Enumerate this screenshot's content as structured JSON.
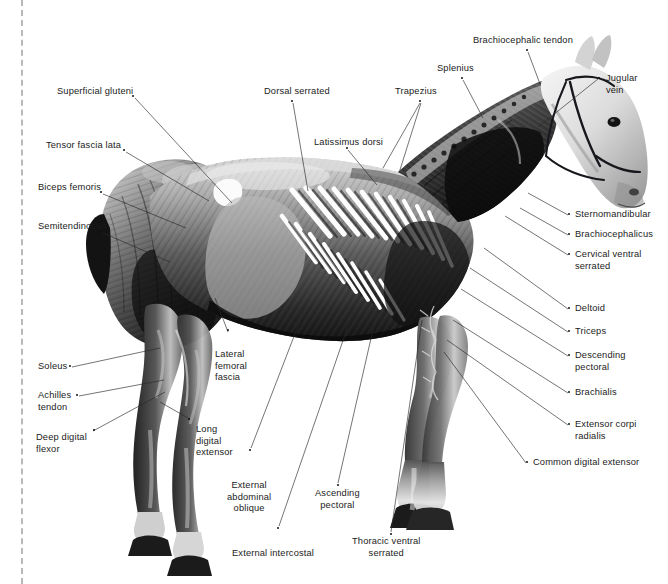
{
  "figure": {
    "view": "left lateral",
    "style": "grayscale anatomical photograph with leader-line callouts",
    "width": 668,
    "height": 584,
    "background_color": "#ffffff",
    "text_color": "#1b1b1b",
    "leader_color": "#2a2a2a",
    "trim_line_color": "#b9b9b9"
  },
  "labels": [
    {
      "id": "superficial-gluteni",
      "text": "Superficial gluteni",
      "side": "left",
      "x": 57,
      "y": 86,
      "align": "left",
      "dot": [
        133,
        96
      ],
      "leaders": [
        [
          [
            135,
            98
          ],
          [
            232,
            203
          ]
        ]
      ]
    },
    {
      "id": "tensor-fascia-lata",
      "text": "Tensor fascia lata",
      "side": "left",
      "x": 46,
      "y": 140,
      "align": "left",
      "dot": [
        124,
        150
      ],
      "leaders": [
        [
          [
            126,
            152
          ],
          [
            209,
            201
          ]
        ]
      ]
    },
    {
      "id": "biceps-femoris",
      "text": "Biceps femoris",
      "side": "left",
      "x": 38,
      "y": 182,
      "align": "left",
      "dot": [
        101,
        192
      ],
      "leaders": [
        [
          [
            103,
            194
          ],
          [
            186,
            228
          ]
        ]
      ]
    },
    {
      "id": "semitendinosus",
      "text": "Semitendinosus",
      "side": "left",
      "x": 38,
      "y": 221,
      "align": "left",
      "dot": [
        101,
        231
      ],
      "leaders": [
        [
          [
            103,
            233
          ],
          [
            170,
            262
          ]
        ]
      ]
    },
    {
      "id": "soleus",
      "text": "Soleus",
      "side": "left",
      "x": 38,
      "y": 361,
      "align": "left",
      "dot": [
        70,
        366
      ],
      "leaders": [
        [
          [
            72,
            367
          ],
          [
            160,
            348
          ]
        ]
      ]
    },
    {
      "id": "achilles-tendon",
      "text": "Achilles\ntendon",
      "side": "left",
      "x": 38,
      "y": 390,
      "align": "left",
      "dot": [
        77,
        395
      ],
      "leaders": [
        [
          [
            79,
            396
          ],
          [
            164,
            380
          ]
        ]
      ]
    },
    {
      "id": "deep-digital-flexor",
      "text": "Deep digital\nflexor",
      "side": "left",
      "x": 36,
      "y": 432,
      "align": "left",
      "dot": [
        94,
        430
      ],
      "leaders": [
        [
          [
            93,
            431
          ],
          [
            165,
            392
          ]
        ]
      ]
    },
    {
      "id": "dorsal-serrated",
      "text": "Dorsal serrated",
      "side": "top",
      "x": 264,
      "y": 86,
      "align": "left",
      "dot": [
        292,
        101
      ],
      "leaders": [
        [
          [
            293,
            103
          ],
          [
            308,
            191
          ]
        ]
      ]
    },
    {
      "id": "latissimus-dorsi",
      "text": "Latissimus dorsi",
      "side": "top",
      "x": 314,
      "y": 137,
      "align": "left",
      "dot": [
        347,
        148
      ],
      "leaders": [
        [
          [
            348,
            150
          ],
          [
            377,
            185
          ]
        ]
      ]
    },
    {
      "id": "trapezius",
      "text": "Trapezius",
      "side": "top",
      "x": 395,
      "y": 86,
      "align": "left",
      "dot": [
        420,
        101
      ],
      "leaders": [
        [
          [
            420,
            103
          ],
          [
            383,
            168
          ]
        ],
        [
          [
            421,
            103
          ],
          [
            399,
            173
          ]
        ]
      ]
    },
    {
      "id": "splenius",
      "text": "Splenius",
      "side": "top",
      "x": 437,
      "y": 63,
      "align": "left",
      "dot": [
        462,
        78
      ],
      "leaders": [
        [
          [
            463,
            80
          ],
          [
            483,
            118
          ]
        ]
      ]
    },
    {
      "id": "brachiocephalic-tendon",
      "text": "Brachiocephalic tendon",
      "side": "top",
      "x": 473,
      "y": 35,
      "align": "left",
      "dot": [
        527,
        50
      ],
      "leaders": [
        [
          [
            528,
            52
          ],
          [
            540,
            84
          ]
        ]
      ]
    },
    {
      "id": "jugular-vein",
      "text": "Jugular\nvein",
      "side": "right",
      "x": 606,
      "y": 73,
      "align": "left",
      "dot": [
        599,
        78
      ],
      "leaders": [
        [
          [
            598,
            79
          ],
          [
            538,
            127
          ]
        ]
      ]
    },
    {
      "id": "sternomandibular",
      "text": "Sternomandibular",
      "side": "right",
      "x": 575,
      "y": 209,
      "align": "left",
      "dot": [
        569,
        214
      ],
      "leaders": [
        [
          [
            568,
            215
          ],
          [
            528,
            193
          ]
        ]
      ]
    },
    {
      "id": "brachiocephalicus",
      "text": "Brachiocephalicus",
      "side": "right",
      "x": 575,
      "y": 229,
      "align": "left",
      "dot": [
        569,
        234
      ],
      "leaders": [
        [
          [
            568,
            235
          ],
          [
            520,
            208
          ]
        ]
      ]
    },
    {
      "id": "cervical-ventral-serrated",
      "text": "Cervical ventral\nserrated",
      "side": "right",
      "x": 575,
      "y": 249,
      "align": "left",
      "dot": [
        569,
        254
      ],
      "leaders": [
        [
          [
            568,
            255
          ],
          [
            505,
            216
          ]
        ]
      ]
    },
    {
      "id": "deltoid",
      "text": "Deltoid",
      "side": "right",
      "x": 575,
      "y": 303,
      "align": "left",
      "dot": [
        569,
        308
      ],
      "leaders": [
        [
          [
            568,
            309
          ],
          [
            484,
            248
          ]
        ]
      ]
    },
    {
      "id": "triceps",
      "text": "Triceps",
      "side": "right",
      "x": 575,
      "y": 326,
      "align": "left",
      "dot": [
        569,
        331
      ],
      "leaders": [
        [
          [
            568,
            332
          ],
          [
            470,
            268
          ]
        ]
      ]
    },
    {
      "id": "descending-pectoral",
      "text": "Descending\npectoral",
      "side": "right",
      "x": 575,
      "y": 350,
      "align": "left",
      "dot": [
        569,
        355
      ],
      "leaders": [
        [
          [
            568,
            356
          ],
          [
            461,
            289
          ]
        ]
      ]
    },
    {
      "id": "brachialis",
      "text": "Brachialis",
      "side": "right",
      "x": 575,
      "y": 387,
      "align": "left",
      "dot": [
        569,
        392
      ],
      "leaders": [
        [
          [
            568,
            393
          ],
          [
            453,
            320
          ]
        ]
      ]
    },
    {
      "id": "extensor-corpi-radialis",
      "text": "Extensor corpi\nradialis",
      "side": "right",
      "x": 575,
      "y": 419,
      "align": "left",
      "dot": [
        569,
        424
      ],
      "leaders": [
        [
          [
            568,
            425
          ],
          [
            447,
            340
          ]
        ]
      ]
    },
    {
      "id": "common-digital-extensor",
      "text": "Common digital extensor",
      "side": "right",
      "x": 533,
      "y": 457,
      "align": "left",
      "dot": [
        527,
        462
      ],
      "leaders": [
        [
          [
            526,
            463
          ],
          [
            444,
            352
          ]
        ]
      ]
    },
    {
      "id": "lateral-femoral-fascia",
      "text": "Lateral\nfemoral\nfascia",
      "side": "bottom",
      "x": 215,
      "y": 349,
      "align": "left",
      "dot": [
        228,
        330
      ],
      "leaders": [
        [
          [
            228,
            332
          ],
          [
            215,
            298
          ]
        ]
      ]
    },
    {
      "id": "long-digital-extensor",
      "text": "Long\ndigital\nextensor",
      "side": "bottom",
      "x": 196,
      "y": 424,
      "align": "left",
      "dot": [
        189,
        419
      ],
      "leaders": [
        [
          [
            188,
            418
          ],
          [
            160,
            402
          ]
        ]
      ]
    },
    {
      "id": "external-abdominal-oblique",
      "text": "External\nabdominal\noblique",
      "side": "bottom",
      "x": 227,
      "y": 480,
      "align": "center",
      "dot": [
        250,
        450
      ],
      "leaders": [
        [
          [
            251,
            448
          ],
          [
            308,
            300
          ]
        ]
      ]
    },
    {
      "id": "external-intercostal",
      "text": "External intercostal",
      "side": "bottom",
      "x": 232,
      "y": 548,
      "align": "center",
      "dot": [
        278,
        528
      ],
      "leaders": [
        [
          [
            279,
            526
          ],
          [
            357,
            300
          ]
        ]
      ]
    },
    {
      "id": "ascending-pectoral",
      "text": "Ascending\npectoral",
      "side": "bottom",
      "x": 315,
      "y": 488,
      "align": "center",
      "dot": [
        338,
        485
      ],
      "leaders": [
        [
          [
            338,
            483
          ],
          [
            377,
            312
          ]
        ]
      ]
    },
    {
      "id": "thoracic-ventral-serrated",
      "text": "Thoracic ventral\nserrated",
      "side": "bottom",
      "x": 352,
      "y": 536,
      "align": "center",
      "dot": [
        391,
        534
      ],
      "leaders": [
        [
          [
            391,
            532
          ],
          [
            422,
            320
          ]
        ]
      ]
    }
  ],
  "image_description": {
    "subject_outline": "standing horse facing right, near fore and hind legs visible, dissected superficial muscles exposed over trunk and neck, pale unmarked head and muzzle, dark hooves",
    "tone_range": "black to white greyscale",
    "notable_features": [
      "white ribbon-like serrated digitations fanning across the thorax",
      "fibrous striations over shoulder and neck",
      "thin dark bridle strap across the head",
      "white patch at the hip over tuber coxae"
    ]
  }
}
